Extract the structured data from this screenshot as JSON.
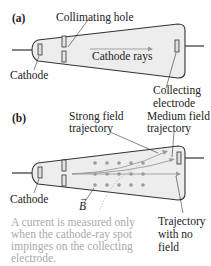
{
  "panel_a": {
    "label": "(a)",
    "collimating_hole": "Collimating hole",
    "cathode_rays": "Cathode rays",
    "cathode": "Cathode",
    "collecting_1": "Collecting",
    "collecting_2": "electrode"
  },
  "panel_b": {
    "label": "(b)",
    "strong_1": "Strong field",
    "strong_2": "trajectory",
    "medium_1": "Medium field",
    "medium_2": "trajectory",
    "cathode": "Cathode",
    "b_field": "B",
    "no_field_1": "Trajectory",
    "no_field_2": "with no",
    "no_field_3": "field",
    "note_1": "A current is measured only",
    "note_2": "when the cathode-ray spot",
    "note_3": "impinges on the collecting",
    "note_4": "electrode."
  },
  "colors": {
    "tube_fill": "#ededed",
    "outline": "#333333",
    "arrow": "#9a9a9a",
    "note": "#a9a9a9"
  }
}
